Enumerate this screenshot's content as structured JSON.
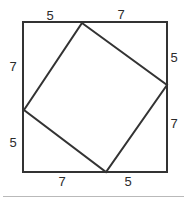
{
  "figure": {
    "canvas": {
      "width": 187,
      "height": 204
    },
    "stroke_color": "#333333",
    "background_color": "#ffffff",
    "divider_color": "#b9b9b9",
    "outer_square": {
      "name": "outer-square",
      "points": "23,22 167,22 167,172 23,172",
      "side_px": 150
    },
    "inner_square": {
      "name": "inner-tilted-square",
      "points": "82,23 167,85 106,172 24,110"
    },
    "labels": {
      "top_left": "5",
      "top_right": "7",
      "right_top": "5",
      "right_bottom": "7",
      "bottom_left": "7",
      "bottom_right": "5",
      "left_top": "7",
      "left_bottom": "5"
    }
  }
}
